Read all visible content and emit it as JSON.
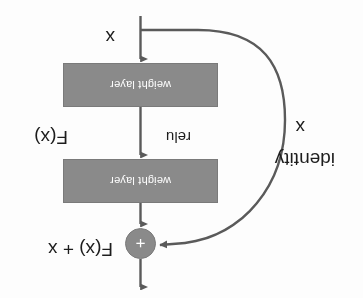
{
  "figure": {
    "orientation_degrees": 180,
    "background_color": "#fdfdfd",
    "box_fill_color": "#8a8a8a",
    "box_text_color": "#ffffff",
    "line_color": "#5a5a5a",
    "text_color": "#1d1d1d"
  },
  "blocks": [
    {
      "id": "weight-layer-1",
      "label": "weight layer"
    },
    {
      "id": "weight-layer-2",
      "label": "weight layer"
    }
  ],
  "operator": {
    "symbol": "+",
    "name": "addition-node"
  },
  "labels": {
    "input_x": "x",
    "relu_middle": "relu",
    "function_fx": "F(x)",
    "shortcut_x": "x",
    "shortcut_identity": "identity",
    "output": "F(x) + x"
  }
}
